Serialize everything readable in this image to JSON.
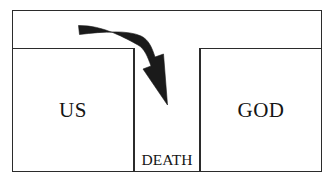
{
  "diagram": {
    "type": "concept-diagram",
    "frame": {
      "stroke_color": "#2b2b2b",
      "fill_color": "#ffffff"
    },
    "cells": [
      {
        "id": "us",
        "label": "US",
        "position": "left",
        "text_size": "large"
      },
      {
        "id": "death",
        "label": "DEATH",
        "position": "center",
        "text_size": "small"
      },
      {
        "id": "god",
        "label": "GOD",
        "position": "right",
        "text_size": "large"
      }
    ],
    "arrow": {
      "name": "curved-down-arrow",
      "color": "#1a1a1a",
      "description": "Thick horizontal shaft curving downward into a barbed arrowhead pointing down-right, blocked by the DEATH column",
      "from": "us",
      "to": "death",
      "direction": "right-then-down"
    }
  }
}
